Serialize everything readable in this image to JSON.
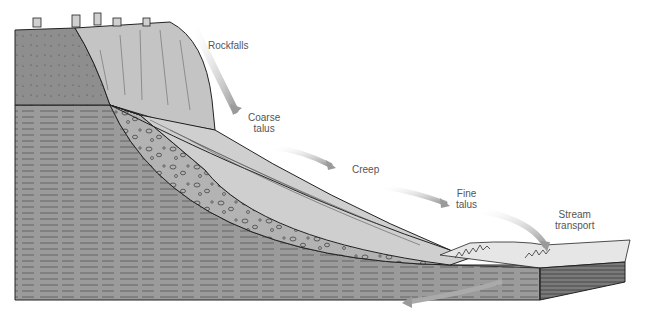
{
  "figure": {
    "type": "geologic cross-section",
    "labels": [
      {
        "id": "rockfalls",
        "text": "Rockfalls"
      },
      {
        "id": "coarse-talus",
        "line1": "Coarse",
        "line2": "talus"
      },
      {
        "id": "creep",
        "text": "Creep"
      },
      {
        "id": "fine-talus",
        "line1": "Fine",
        "line2": "talus"
      },
      {
        "id": "stream-transport",
        "line1": "Stream",
        "line2": "transport"
      }
    ],
    "colors": {
      "bedrock_upper": "#8c8c8c",
      "bedrock_lower": "#9a9a9a",
      "cliff_face": "#c4c4c4",
      "talus_surface": "#cfcfcf",
      "coarse_debris": "#b0b0b0",
      "arrow": "#b8b8b8",
      "outline": "#222222",
      "stream_bank": "#e6e6e6"
    }
  }
}
